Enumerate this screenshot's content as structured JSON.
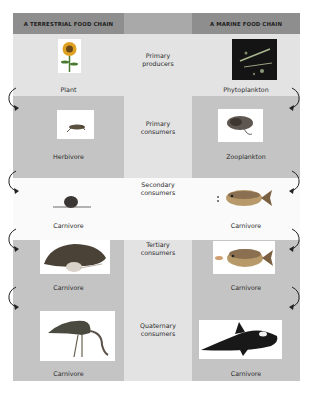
{
  "headers": {
    "terrestrial": "A TERRESTRIAL FOOD CHAIN",
    "marine": "A MARINE FOOD CHAIN"
  },
  "levels": [
    {
      "name": "Primary\nproducers",
      "line1": "Primary",
      "line2": "producers",
      "terrestrial": "Plant",
      "marine": "Phytoplankton",
      "terrestrial_icon": "sunflower-image",
      "marine_icon": "phytoplankton-image"
    },
    {
      "name": "Primary consumers",
      "line1": "Primary",
      "line2": "consumers",
      "terrestrial": "Herbivore",
      "marine": "Zooplankton",
      "terrestrial_icon": "grasshopper-image",
      "marine_icon": "zooplankton-image"
    },
    {
      "name": "Secondary consumers",
      "line1": "Secondary",
      "line2": "consumers",
      "terrestrial": "Carnivore",
      "marine": "Carnivore",
      "terrestrial_icon": "mouse-image",
      "marine_icon": "small-fish-image"
    },
    {
      "name": "Tertiary consumers",
      "line1": "Tertiary",
      "line2": "consumers",
      "terrestrial": "Carnivore",
      "marine": "Carnivore",
      "terrestrial_icon": "snake-image",
      "marine_icon": "fish-image"
    },
    {
      "name": "Quaternary consumers",
      "line1": "Quaternary",
      "line2": "consumers",
      "terrestrial": "Carnivore",
      "marine": "Carnivore",
      "terrestrial_icon": "hawk-image",
      "marine_icon": "orca-image"
    }
  ],
  "colors": {
    "header": "#8e8e8e",
    "row_dark": "#c4c4c4",
    "row_light": "#e3e3e3",
    "row_white": "#fafafa"
  }
}
